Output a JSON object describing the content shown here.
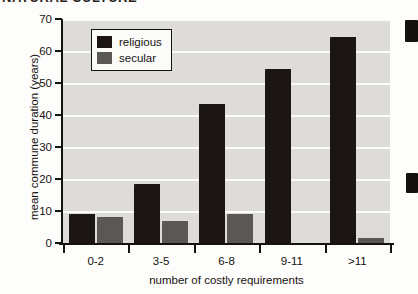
{
  "page": {
    "cropped_heading_text": "NATURAL CULTURE",
    "edge_marks": [
      "page-edge-mark-top",
      "page-edge-mark-bottom"
    ]
  },
  "chart_data": {
    "type": "bar",
    "title": "",
    "xlabel": "number of costly requirements",
    "ylabel": "mean commune duration (years)",
    "categories": [
      "0-2",
      "3-5",
      "6-8",
      "9-11",
      ">11"
    ],
    "series": [
      {
        "name": "religious",
        "color": "#1b1613",
        "values": [
          9,
          18.5,
          43.5,
          54.5,
          64.5
        ]
      },
      {
        "name": "secular",
        "color": "#5b5755",
        "values": [
          8.2,
          7,
          9,
          0,
          1.5
        ]
      }
    ],
    "ylim": [
      0,
      70
    ],
    "yticks": [
      0,
      10,
      20,
      30,
      40,
      50,
      60,
      70
    ],
    "ytick_labels": [
      "0",
      "10",
      "20",
      "30",
      "40",
      "50",
      "60",
      "70"
    ],
    "grid": true,
    "grid_color": "#fbfbfa",
    "plot_background": "#dddcda",
    "legend_position": "upper-left",
    "legend_entries": [
      "religious",
      "secular"
    ]
  }
}
